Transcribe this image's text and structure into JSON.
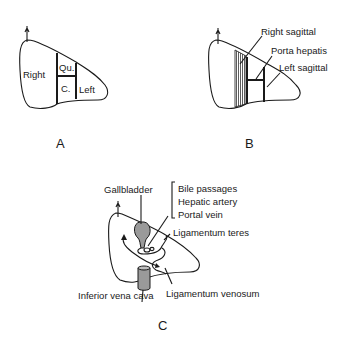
{
  "panels": {
    "a": {
      "caption": "A",
      "labels": {
        "right": "Right",
        "quadrate": "Qu.",
        "caudate": "C.",
        "left": "Left"
      }
    },
    "b": {
      "caption": "B",
      "labels": {
        "right_sagittal": "Right sagittal",
        "porta_hepatis": "Porta hepatis",
        "left_sagittal": "Left sagittal"
      }
    },
    "c": {
      "caption": "C",
      "labels": {
        "gallbladder": "Gallbladder",
        "bile_passages": "Bile passages",
        "hepatic_artery": "Hepatic artery",
        "portal_vein": "Portal vein",
        "ligamentum_teres": "Ligamentum teres",
        "inferior_vena_cava": "Inferior vena cava",
        "ligamentum_venosum": "Ligamentum venosum"
      }
    }
  }
}
